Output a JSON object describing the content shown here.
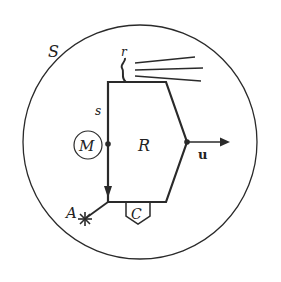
{
  "diagram": {
    "type": "system-diagram",
    "colors": {
      "stroke": "#2a2a2a",
      "background": "#ffffff"
    },
    "labels": {
      "system": "S",
      "receptor": "r",
      "sensor_channel": "s",
      "memory": "M",
      "regulator": "R",
      "output": "u",
      "actuator": "A",
      "controller": "C"
    },
    "elements": [
      {
        "id": "system-boundary",
        "shape": "circle",
        "label": "S"
      },
      {
        "id": "regulator-block",
        "shape": "pentagon",
        "label": "R"
      },
      {
        "id": "memory-node",
        "shape": "circle",
        "label": "M"
      },
      {
        "id": "receptor",
        "shape": "squiggle",
        "label": "r"
      },
      {
        "id": "input-rays",
        "shape": "lines",
        "count": 3
      },
      {
        "id": "output-arrow",
        "shape": "arrow",
        "label": "u"
      },
      {
        "id": "actuator",
        "shape": "star",
        "label": "A"
      },
      {
        "id": "controller-box",
        "shape": "pentagon-down",
        "label": "C"
      }
    ]
  }
}
